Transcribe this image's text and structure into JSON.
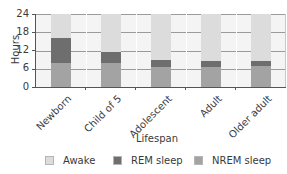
{
  "chart_data": {
    "type": "bar",
    "stacked": true,
    "title": "",
    "xlabel": "Lifespan",
    "ylabel": "Hours",
    "ylim": [
      0,
      24
    ],
    "yticks": [
      "0",
      "6",
      "12",
      "18",
      "24"
    ],
    "grid": true,
    "legend_position": "bottom",
    "categories": [
      "Newborn",
      "Child of 5",
      "Adolescent",
      "Adult",
      "Older adult"
    ],
    "series": [
      {
        "name": "NREM sleep",
        "color": "#a3a3a3",
        "values": [
          8,
          8,
          6.5,
          6.5,
          7
        ]
      },
      {
        "name": "REM sleep",
        "color": "#6e6e6e",
        "values": [
          8,
          3.5,
          2.5,
          2,
          1.5
        ]
      },
      {
        "name": "Awake",
        "color": "#dcdcdc",
        "values": [
          8,
          12.5,
          15,
          15.5,
          15.5
        ]
      }
    ]
  },
  "axis": {
    "y_title": "Hours",
    "x_title": "Lifespan",
    "y_ticks": [
      "24",
      "18",
      "12",
      "6",
      "0"
    ],
    "x_labels": [
      "Newborn",
      "Child of 5",
      "Adolescent",
      "Adult",
      "Older adult"
    ]
  },
  "legend": {
    "items": [
      {
        "label": "Awake",
        "color": "#dcdcdc"
      },
      {
        "label": "REM sleep",
        "color": "#6e6e6e"
      },
      {
        "label": "NREM sleep",
        "color": "#a3a3a3"
      }
    ]
  }
}
